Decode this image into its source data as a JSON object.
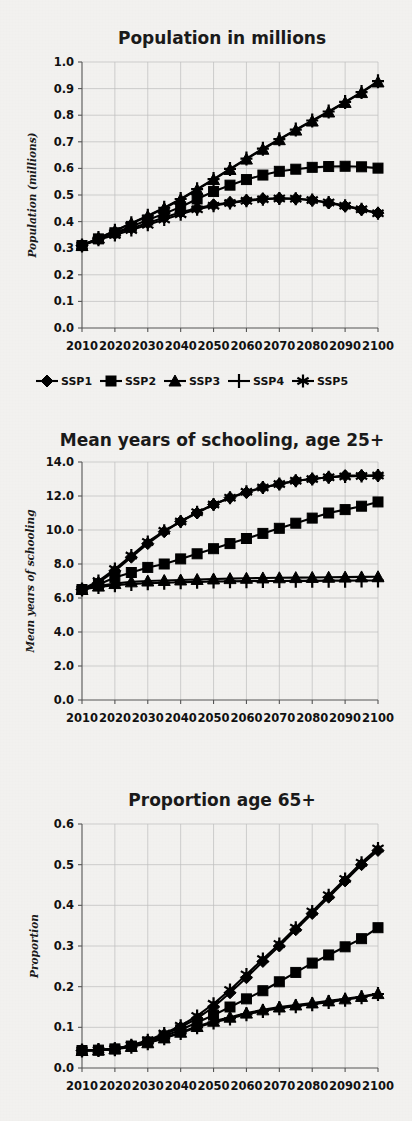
{
  "figure": {
    "kind": "multi-panel-line-chart-figure",
    "panel_count": 3,
    "background_color": "#f4f3f1",
    "ink_color": "#000000",
    "grid_color": "#bdbdbd"
  },
  "legend": {
    "position": "below-panel-1",
    "entries": [
      {
        "label": "SSP1",
        "marker": "diamond"
      },
      {
        "label": "SSP2",
        "marker": "square"
      },
      {
        "label": "SSP3",
        "marker": "triangle"
      },
      {
        "label": "SSP4",
        "marker": "plus"
      },
      {
        "label": "SSP5",
        "marker": "asterisk"
      }
    ]
  },
  "chart_data": [
    {
      "id": "population",
      "type": "line",
      "title": "Population in millions",
      "xlabel": "",
      "ylabel": "Population (millions)",
      "x": [
        2010,
        2015,
        2020,
        2025,
        2030,
        2035,
        2040,
        2045,
        2050,
        2055,
        2060,
        2065,
        2070,
        2075,
        2080,
        2085,
        2090,
        2095,
        2100
      ],
      "xlim": [
        2010,
        2100
      ],
      "ylim": [
        0.0,
        1.0
      ],
      "ytick_labels": [
        "0.0",
        "0.1",
        "0.2",
        "0.3",
        "0.4",
        "0.5",
        "0.6",
        "0.7",
        "0.8",
        "0.9",
        "1.0"
      ],
      "ytick_values": [
        0.0,
        0.1,
        0.2,
        0.3,
        0.4,
        0.5,
        0.6,
        0.7,
        0.8,
        0.9,
        1.0
      ],
      "xtick_labels": [
        "2010",
        "2020",
        "2030",
        "2040",
        "2050",
        "2060",
        "2070",
        "2080",
        "2090",
        "2100"
      ],
      "xtick_values": [
        2010,
        2020,
        2030,
        2040,
        2050,
        2060,
        2070,
        2080,
        2090,
        2100
      ],
      "grid": true,
      "series": [
        {
          "name": "SSP1",
          "marker": "diamond",
          "values": [
            0.31,
            0.335,
            0.355,
            0.375,
            0.395,
            0.415,
            0.435,
            0.45,
            0.463,
            0.472,
            0.48,
            0.486,
            0.488,
            0.486,
            0.48,
            0.47,
            0.458,
            0.445,
            0.432
          ]
        },
        {
          "name": "SSP2",
          "marker": "square",
          "values": [
            0.31,
            0.335,
            0.358,
            0.382,
            0.406,
            0.43,
            0.455,
            0.485,
            0.513,
            0.537,
            0.558,
            0.575,
            0.589,
            0.597,
            0.604,
            0.607,
            0.608,
            0.606,
            0.601
          ]
        },
        {
          "name": "SSP3",
          "marker": "triangle",
          "values": [
            0.31,
            0.338,
            0.365,
            0.393,
            0.42,
            0.45,
            0.483,
            0.52,
            0.558,
            0.596,
            0.635,
            0.672,
            0.708,
            0.744,
            0.778,
            0.812,
            0.848,
            0.885,
            0.925
          ]
        },
        {
          "name": "SSP4",
          "marker": "plus",
          "values": [
            0.31,
            0.338,
            0.366,
            0.394,
            0.422,
            0.452,
            0.485,
            0.522,
            0.56,
            0.598,
            0.637,
            0.674,
            0.71,
            0.746,
            0.78,
            0.814,
            0.85,
            0.887,
            0.928
          ]
        },
        {
          "name": "SSP5",
          "marker": "asterisk",
          "values": [
            0.31,
            0.332,
            0.35,
            0.368,
            0.388,
            0.408,
            0.428,
            0.446,
            0.46,
            0.47,
            0.478,
            0.484,
            0.487,
            0.486,
            0.481,
            0.472,
            0.46,
            0.446,
            0.431
          ]
        }
      ]
    },
    {
      "id": "schooling",
      "type": "line",
      "title": "Mean years of schooling, age 25+",
      "xlabel": "",
      "ylabel": "Mean years of schooling",
      "x": [
        2010,
        2015,
        2020,
        2025,
        2030,
        2035,
        2040,
        2045,
        2050,
        2055,
        2060,
        2065,
        2070,
        2075,
        2080,
        2085,
        2090,
        2095,
        2100
      ],
      "xlim": [
        2010,
        2100
      ],
      "ylim": [
        0.0,
        14.0
      ],
      "ytick_labels": [
        "0.0",
        "2.0",
        "4.0",
        "6.0",
        "8.0",
        "10.0",
        "12.0",
        "14.0"
      ],
      "ytick_values": [
        0.0,
        2.0,
        4.0,
        6.0,
        8.0,
        10.0,
        12.0,
        14.0
      ],
      "xtick_labels": [
        "2010",
        "2020",
        "2030",
        "2040",
        "2050",
        "2060",
        "2070",
        "2080",
        "2090",
        "2100"
      ],
      "xtick_values": [
        2010,
        2020,
        2030,
        2040,
        2050,
        2060,
        2070,
        2080,
        2090,
        2100
      ],
      "grid": true,
      "series": [
        {
          "name": "SSP1",
          "marker": "diamond",
          "values": [
            6.5,
            6.9,
            7.6,
            8.4,
            9.2,
            9.9,
            10.5,
            11.0,
            11.5,
            11.9,
            12.2,
            12.5,
            12.7,
            12.9,
            13.0,
            13.1,
            13.2,
            13.2,
            13.2
          ]
        },
        {
          "name": "SSP2",
          "marker": "square",
          "values": [
            6.5,
            6.8,
            7.2,
            7.5,
            7.8,
            8.0,
            8.3,
            8.6,
            8.9,
            9.2,
            9.5,
            9.8,
            10.1,
            10.4,
            10.7,
            11.0,
            11.2,
            11.4,
            11.65
          ]
        },
        {
          "name": "SSP3",
          "marker": "triangle",
          "values": [
            6.5,
            6.7,
            6.85,
            6.95,
            7.0,
            7.03,
            7.06,
            7.09,
            7.12,
            7.14,
            7.16,
            7.18,
            7.19,
            7.2,
            7.21,
            7.22,
            7.23,
            7.24,
            7.25
          ]
        },
        {
          "name": "SSP4",
          "marker": "plus",
          "values": [
            6.5,
            6.65,
            6.75,
            6.82,
            6.87,
            6.9,
            6.93,
            6.95,
            6.97,
            6.98,
            6.99,
            7.0,
            7.0,
            7.01,
            7.01,
            7.02,
            7.02,
            7.03,
            7.03
          ]
        },
        {
          "name": "SSP5",
          "marker": "asterisk",
          "values": [
            6.5,
            7.0,
            7.7,
            8.5,
            9.3,
            9.95,
            10.5,
            11.05,
            11.5,
            11.9,
            12.25,
            12.5,
            12.7,
            12.9,
            13.0,
            13.1,
            13.15,
            13.18,
            13.2
          ]
        }
      ]
    },
    {
      "id": "proportion",
      "type": "line",
      "title": "Proportion age 65+",
      "xlabel": "",
      "ylabel": "Proportion",
      "x": [
        2010,
        2015,
        2020,
        2025,
        2030,
        2035,
        2040,
        2045,
        2050,
        2055,
        2060,
        2065,
        2070,
        2075,
        2080,
        2085,
        2090,
        2095,
        2100
      ],
      "xlim": [
        2010,
        2100
      ],
      "ylim": [
        0.0,
        0.6
      ],
      "ytick_labels": [
        "0.0",
        "0.1",
        "0.2",
        "0.3",
        "0.4",
        "0.5",
        "0.6"
      ],
      "ytick_values": [
        0.0,
        0.1,
        0.2,
        0.3,
        0.4,
        0.5,
        0.6
      ],
      "xtick_labels": [
        "2010",
        "2020",
        "2030",
        "2040",
        "2050",
        "2060",
        "2070",
        "2080",
        "2090",
        "2100"
      ],
      "xtick_values": [
        2010,
        2020,
        2030,
        2040,
        2050,
        2060,
        2070,
        2080,
        2090,
        2100
      ],
      "grid": true,
      "series": [
        {
          "name": "SSP1",
          "marker": "diamond",
          "values": [
            0.043,
            0.044,
            0.047,
            0.055,
            0.066,
            0.082,
            0.1,
            0.122,
            0.15,
            0.185,
            0.222,
            0.262,
            0.3,
            0.34,
            0.38,
            0.42,
            0.46,
            0.5,
            0.535
          ]
        },
        {
          "name": "SSP2",
          "marker": "square",
          "values": [
            0.043,
            0.044,
            0.047,
            0.054,
            0.064,
            0.078,
            0.094,
            0.112,
            0.13,
            0.15,
            0.17,
            0.19,
            0.212,
            0.235,
            0.258,
            0.278,
            0.298,
            0.318,
            0.345
          ]
        },
        {
          "name": "SSP3",
          "marker": "triangle",
          "values": [
            0.043,
            0.044,
            0.047,
            0.053,
            0.062,
            0.074,
            0.088,
            0.102,
            0.115,
            0.125,
            0.135,
            0.143,
            0.15,
            0.155,
            0.16,
            0.165,
            0.17,
            0.176,
            0.183
          ]
        },
        {
          "name": "SSP4",
          "marker": "plus",
          "values": [
            0.043,
            0.044,
            0.046,
            0.052,
            0.061,
            0.073,
            0.086,
            0.1,
            0.112,
            0.122,
            0.132,
            0.14,
            0.147,
            0.152,
            0.157,
            0.162,
            0.168,
            0.174,
            0.182
          ]
        },
        {
          "name": "SSP5",
          "marker": "asterisk",
          "values": [
            0.043,
            0.044,
            0.047,
            0.056,
            0.068,
            0.085,
            0.104,
            0.128,
            0.158,
            0.192,
            0.23,
            0.268,
            0.305,
            0.345,
            0.385,
            0.425,
            0.465,
            0.505,
            0.54
          ]
        }
      ]
    }
  ]
}
